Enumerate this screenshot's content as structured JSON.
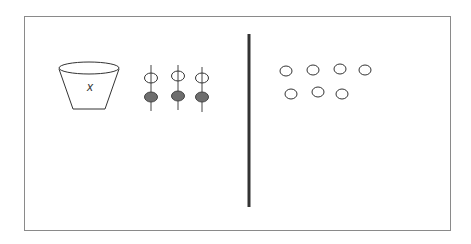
{
  "diagram": {
    "type": "equation-model",
    "left_side": {
      "cup": {
        "label": "x"
      },
      "counter_pairs": [
        {
          "top": "open",
          "bottom": "filled"
        },
        {
          "top": "open",
          "bottom": "filled"
        },
        {
          "top": "open",
          "bottom": "filled"
        }
      ]
    },
    "divider": "vertical-line",
    "right_side": {
      "open_counters": 7,
      "rows": [
        4,
        3
      ]
    },
    "colors": {
      "stroke": "#333333",
      "filled_counter": "#6e6e6e",
      "divider": "#333333",
      "frame": "#8a8a8a"
    }
  }
}
